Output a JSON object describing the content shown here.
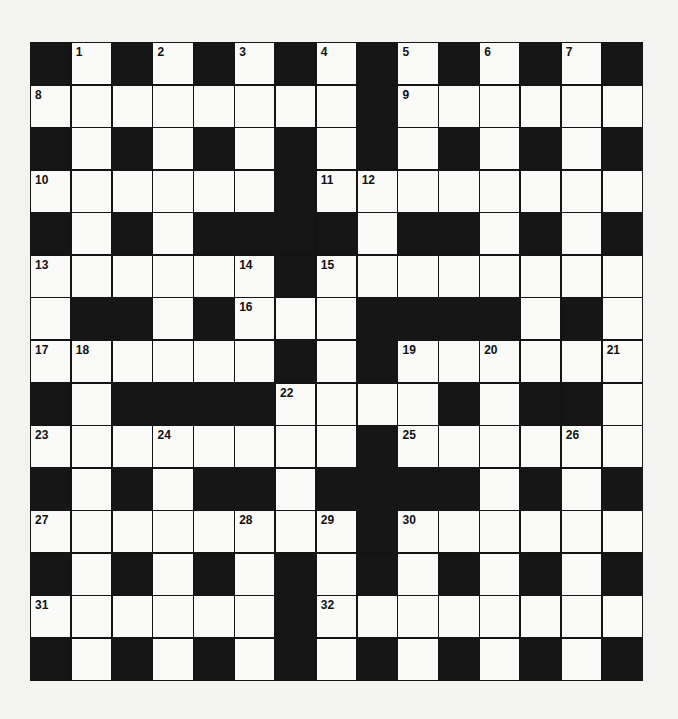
{
  "puzzle": {
    "type": "crossword",
    "rows": 15,
    "cols": 15,
    "grid": [
      "#.#.#.#.#.#.#.#",
      "........#......",
      "#.#.#.#.#.#.#.#",
      "......#........",
      "#.#.####.##.#.#",
      "......#........",
      ".##.#...####.#.",
      "......#.#......",
      "#.####....#.##.",
      "........#......",
      "#.#.##.####.#.#",
      "........#......",
      "#.#.#.#.#.#.#.#",
      "......#........",
      "#.#.#.#.#.#.#.#"
    ],
    "numbers": [
      {
        "r": 0,
        "c": 1,
        "n": "1"
      },
      {
        "r": 0,
        "c": 3,
        "n": "2"
      },
      {
        "r": 0,
        "c": 5,
        "n": "3"
      },
      {
        "r": 0,
        "c": 7,
        "n": "4"
      },
      {
        "r": 0,
        "c": 9,
        "n": "5"
      },
      {
        "r": 0,
        "c": 11,
        "n": "6"
      },
      {
        "r": 0,
        "c": 13,
        "n": "7"
      },
      {
        "r": 1,
        "c": 0,
        "n": "8"
      },
      {
        "r": 1,
        "c": 9,
        "n": "9"
      },
      {
        "r": 3,
        "c": 0,
        "n": "10"
      },
      {
        "r": 3,
        "c": 7,
        "n": "11"
      },
      {
        "r": 3,
        "c": 8,
        "n": "12"
      },
      {
        "r": 5,
        "c": 0,
        "n": "13"
      },
      {
        "r": 5,
        "c": 5,
        "n": "14"
      },
      {
        "r": 5,
        "c": 7,
        "n": "15"
      },
      {
        "r": 6,
        "c": 5,
        "n": "16"
      },
      {
        "r": 7,
        "c": 0,
        "n": "17"
      },
      {
        "r": 7,
        "c": 1,
        "n": "18"
      },
      {
        "r": 7,
        "c": 9,
        "n": "19"
      },
      {
        "r": 7,
        "c": 11,
        "n": "20"
      },
      {
        "r": 7,
        "c": 14,
        "n": "21"
      },
      {
        "r": 8,
        "c": 6,
        "n": "22"
      },
      {
        "r": 9,
        "c": 0,
        "n": "23"
      },
      {
        "r": 9,
        "c": 3,
        "n": "24"
      },
      {
        "r": 9,
        "c": 9,
        "n": "25"
      },
      {
        "r": 9,
        "c": 13,
        "n": "26"
      },
      {
        "r": 11,
        "c": 0,
        "n": "27"
      },
      {
        "r": 11,
        "c": 5,
        "n": "28"
      },
      {
        "r": 11,
        "c": 7,
        "n": "29"
      },
      {
        "r": 11,
        "c": 9,
        "n": "30"
      },
      {
        "r": 13,
        "c": 0,
        "n": "31"
      },
      {
        "r": 13,
        "c": 7,
        "n": "32"
      }
    ],
    "colors": {
      "block": "#161616",
      "cell": "#fafaf8",
      "paper": "#f3f3f1"
    }
  }
}
